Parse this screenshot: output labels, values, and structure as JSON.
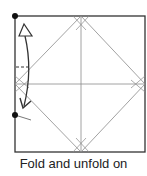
{
  "diagram": {
    "type": "origami-step",
    "caption": "Fold and unfold on",
    "colors": {
      "outline": "#333333",
      "crease": "#8a8a8a",
      "arrow": "#333333",
      "dot": "#111111"
    },
    "square": {
      "x": 15,
      "y": 16,
      "size": 130
    },
    "markers": [
      {
        "name": "top-left-dot",
        "x": 15,
        "y": 16
      },
      {
        "name": "left-mid-dot",
        "x": 15,
        "y": 115
      }
    ],
    "annotations": {
      "arrow": "fold-and-unfold arrow (hollow head up, solid head down)",
      "dashed_mark": "pinch mark on left edge"
    }
  }
}
